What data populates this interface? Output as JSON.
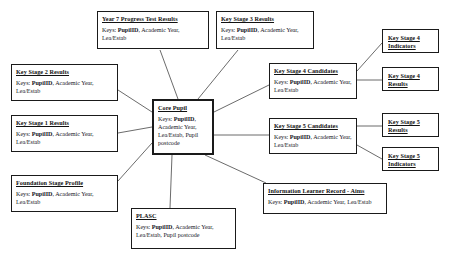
{
  "diagram": {
    "type": "entity-relationship-hub-spoke",
    "keys_label": "Keys:",
    "nodes": [
      {
        "id": "core-pupil",
        "title": "Core Pupil",
        "keys_prefix": "Keys: ",
        "keys_bold": "PupilID",
        "keys_rest": ", Academic Year, Lea/Estab, Pupil postcode",
        "keys_full": "Keys: PupilID, Academic Year, Lea/Estab, Pupil postcode",
        "x": 152,
        "y": 99,
        "w": 62,
        "h": 56,
        "hub": true
      },
      {
        "id": "year-7-progress-test-results",
        "title": "Year 7 Progress Test Results",
        "keys_prefix": "Keys: ",
        "keys_bold": "PupilID",
        "keys_rest": ", Academic Year, Lea/Estab",
        "keys_full": "Keys: PupilID, Academic Year, Lea/Estab",
        "x": 97,
        "y": 11,
        "w": 112,
        "h": 38,
        "hub": false
      },
      {
        "id": "key-stage-3-results",
        "title": "Key Stage 3 Results",
        "keys_prefix": "Keys: ",
        "keys_bold": "PupilID",
        "keys_rest": ", Academic Year, Lea/Estab",
        "keys_full": "Keys: PupilID, Academic Year, Lea/Estab",
        "x": 216,
        "y": 11,
        "w": 98,
        "h": 38,
        "hub": false
      },
      {
        "id": "key-stage-2-results",
        "title": "Key Stage 2 Results",
        "keys_prefix": "Keys: ",
        "keys_bold": "PupilID",
        "keys_rest": ", Academic Year, Lea/Estab",
        "keys_full": "Keys: PupilID, Academic Year, Lea/Estab",
        "x": 11,
        "y": 64,
        "w": 107,
        "h": 37,
        "hub": false
      },
      {
        "id": "key-stage-1-results",
        "title": "Key Stage 1 Results",
        "keys_prefix": "Keys: ",
        "keys_bold": "PupilID",
        "keys_rest": ", Academic Year, Lea/Estab",
        "keys_full": "Keys: PupilID, Academic Year, Lea/Estab",
        "x": 11,
        "y": 115,
        "w": 107,
        "h": 37,
        "hub": false
      },
      {
        "id": "foundation-stage-profile",
        "title": "Foundation Stage Profile",
        "keys_prefix": "Keys: ",
        "keys_bold": "PupilID",
        "keys_rest": ", Academic Year, Lea/Estab",
        "keys_full": "Keys: PupilID, Academic Year, Lea/Estab",
        "x": 11,
        "y": 175,
        "w": 107,
        "h": 37,
        "hub": false
      },
      {
        "id": "plasc",
        "title": "PLASC",
        "keys_prefix": "Keys: ",
        "keys_bold": "PupilID",
        "keys_rest": ", Academic Year, Lea/Estab, Pupil postcode",
        "keys_full": "Keys: PupilID, Academic Year, Lea/Estab, Pupil postcode",
        "x": 131,
        "y": 208,
        "w": 105,
        "h": 41,
        "hub": false
      },
      {
        "id": "information-learner-record-aims",
        "title": "Information Learner Record - Aims",
        "keys_prefix": "Keys: ",
        "keys_bold": "PupilID",
        "keys_rest": ", Academic Year, Lea/Estab",
        "keys_full": "Keys: PupilID, Academic Year, Lea/Estab",
        "x": 263,
        "y": 183,
        "w": 124,
        "h": 31,
        "hub": false
      },
      {
        "id": "key-stage-4-candidates",
        "title": "Key Stage 4 Candidates",
        "keys_prefix": "Keys: ",
        "keys_bold": "PupilID",
        "keys_rest": ", Academic Year, Lea/Estab",
        "keys_full": "Keys: PupilID, Academic Year, Lea/Estab",
        "x": 269,
        "y": 63,
        "w": 88,
        "h": 36,
        "hub": false
      },
      {
        "id": "key-stage-5-candidates",
        "title": "Key Stage 5 Candidates",
        "keys_prefix": "Keys: ",
        "keys_bold": "PupilID",
        "keys_rest": ", Academic Year, Lea/Estab",
        "keys_full": "Keys: PupilID, Academic Year, Lea/Estab",
        "x": 269,
        "y": 118,
        "w": 88,
        "h": 36,
        "hub": false
      },
      {
        "id": "key-stage-4-indicators",
        "title": "Key Stage 4\nIndicators",
        "keys_full": "",
        "x": 382,
        "y": 29,
        "w": 57,
        "h": 24,
        "hub": false,
        "small": true
      },
      {
        "id": "key-stage-4-results",
        "title": "Key Stage 4\nResults",
        "keys_full": "",
        "x": 382,
        "y": 67,
        "w": 57,
        "h": 24,
        "hub": false,
        "small": true
      },
      {
        "id": "key-stage-5-results",
        "title": "Key Stage 5\nResults",
        "keys_full": "",
        "x": 382,
        "y": 113,
        "w": 57,
        "h": 24,
        "hub": false,
        "small": true
      },
      {
        "id": "key-stage-5-indicators",
        "title": "Key Stage 5\nIndicators",
        "keys_full": "",
        "x": 382,
        "y": 147,
        "w": 57,
        "h": 24,
        "hub": false,
        "small": true
      }
    ],
    "edges": [
      {
        "from": "core-pupil",
        "to": "year-7-progress-test-results",
        "x1": 178,
        "y1": 99,
        "x2": 160,
        "y2": 50
      },
      {
        "from": "core-pupil",
        "to": "key-stage-3-results",
        "x1": 198,
        "y1": 99,
        "x2": 238,
        "y2": 50
      },
      {
        "from": "core-pupil",
        "to": "key-stage-2-results",
        "x1": 152,
        "y1": 112,
        "x2": 118,
        "y2": 90
      },
      {
        "from": "core-pupil",
        "to": "key-stage-1-results",
        "x1": 152,
        "y1": 127,
        "x2": 118,
        "y2": 133
      },
      {
        "from": "core-pupil",
        "to": "foundation-stage-profile",
        "x1": 152,
        "y1": 143,
        "x2": 118,
        "y2": 181
      },
      {
        "from": "core-pupil",
        "to": "plasc",
        "x1": 172,
        "y1": 155,
        "x2": 170,
        "y2": 208
      },
      {
        "from": "core-pupil",
        "to": "information-learner-record-aims",
        "x1": 205,
        "y1": 155,
        "x2": 266,
        "y2": 183
      },
      {
        "from": "core-pupil",
        "to": "key-stage-4-candidates",
        "x1": 214,
        "y1": 112,
        "x2": 269,
        "y2": 85
      },
      {
        "from": "core-pupil",
        "to": "key-stage-5-candidates",
        "x1": 214,
        "y1": 135,
        "x2": 269,
        "y2": 135
      },
      {
        "from": "key-stage-4-candidates",
        "to": "key-stage-4-indicators",
        "x1": 357,
        "y1": 71,
        "x2": 382,
        "y2": 43
      },
      {
        "from": "key-stage-4-candidates",
        "to": "key-stage-4-results",
        "x1": 357,
        "y1": 80,
        "x2": 382,
        "y2": 80
      },
      {
        "from": "key-stage-5-candidates",
        "to": "key-stage-5-results",
        "x1": 357,
        "y1": 126,
        "x2": 382,
        "y2": 126
      },
      {
        "from": "key-stage-5-candidates",
        "to": "key-stage-5-indicators",
        "x1": 357,
        "y1": 145,
        "x2": 382,
        "y2": 159
      }
    ],
    "colors": {
      "background": "#ffffff",
      "node_border": "#1a1a1a",
      "edge": "#5a5a5a",
      "text": "#15151d"
    }
  }
}
